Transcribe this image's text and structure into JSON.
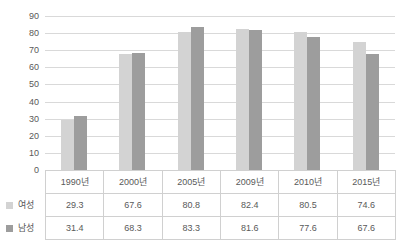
{
  "chart_data": {
    "type": "bar",
    "title": "",
    "xlabel": "",
    "ylabel": "",
    "ylim": [
      0,
      90
    ],
    "grid": true,
    "legend_position": "table-left",
    "categories": [
      "1990년",
      "2000년",
      "2005년",
      "2009년",
      "2010년",
      "2015년"
    ],
    "yticks": [
      "90",
      "80",
      "70",
      "60",
      "50",
      "40",
      "30",
      "20",
      "10",
      "0"
    ],
    "series": [
      {
        "name": "여성",
        "color": "#d3d3d3",
        "values": [
          29.3,
          67.6,
          80.8,
          82.4,
          80.5,
          74.6
        ]
      },
      {
        "name": "남성",
        "color": "#9d9d9d",
        "values": [
          31.4,
          68.3,
          83.3,
          81.6,
          77.6,
          67.6
        ]
      }
    ],
    "table": {
      "header": [
        "1990년",
        "2000년",
        "2005년",
        "2009년",
        "2010년",
        "2015년"
      ],
      "rows": [
        {
          "label": "여성",
          "swatch": "female",
          "values": [
            "29.3",
            "67.6",
            "80.8",
            "82.4",
            "80.5",
            "74.6"
          ]
        },
        {
          "label": "남성",
          "swatch": "male",
          "values": [
            "31.4",
            "68.3",
            "83.3",
            "81.6",
            "77.6",
            "67.6"
          ]
        }
      ]
    }
  },
  "colors": {
    "female": "#d3d3d3",
    "male": "#9d9d9d",
    "gridline": "#d9d9d9",
    "text": "#595959",
    "table_border": "#d0d0d0",
    "background": "#ffffff"
  }
}
